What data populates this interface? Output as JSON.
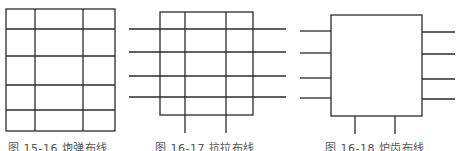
{
  "figures": [
    {
      "id": "fig1",
      "caption": "图 15-16   炮弹布线",
      "description": "Rectangular grid, 3 columns × 5 rows, no extending lines"
    },
    {
      "id": "fig2",
      "caption": "图 16-17   抗拉布线",
      "description": "Rectangle with 4 horizontal lines extending left and right and 2 vertical lines extending below"
    },
    {
      "id": "fig3",
      "caption": "图 16-18   炉齿布线",
      "description": "Empty rectangle with 4 stubs on left, 4 stubs on right, 2 stubs on bottom"
    }
  ],
  "colors": {
    "stroke": "#2b2b2b",
    "background": "#ffffff",
    "caption": "#555555"
  }
}
